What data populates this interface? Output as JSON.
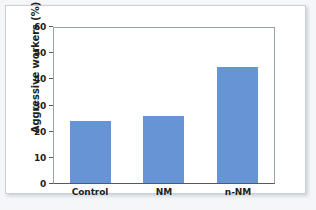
{
  "chart_data": {
    "type": "bar",
    "title": "",
    "subtitle": "",
    "categories": [
      "Control",
      "NM",
      "n-NM"
    ],
    "values": [
      24,
      26,
      45
    ],
    "series": [
      {
        "name": "Aggressive workers",
        "values": [
          24,
          26,
          45
        ]
      }
    ],
    "xlabel": "",
    "ylabel": "Aggressive workers (%)",
    "ylim": [
      0,
      60
    ],
    "y_ticks": [
      0,
      10,
      20,
      30,
      40,
      50,
      60
    ],
    "y_tick_labels": [
      "0",
      "10",
      "20",
      "30",
      "40",
      "50",
      "60"
    ],
    "grid": false,
    "legend": false,
    "legend_position": "none",
    "bar_color": "#6694d4",
    "plot_background": "#ffffff",
    "axis_color": "#55595d",
    "frame_color": "#c9cfd6",
    "page_background": "#f4f6f8"
  },
  "axis": {
    "y_title": "Aggressive workers (%)"
  }
}
